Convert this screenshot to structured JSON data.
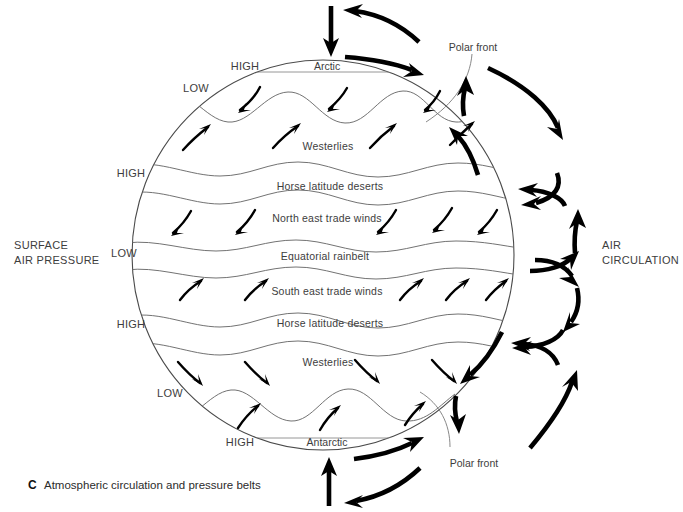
{
  "figure": {
    "caption_letter": "C",
    "caption_text": "Atmospheric circulation and pressure belts"
  },
  "side_labels": {
    "left_line1": "SURFACE",
    "left_line2": "AIR PRESSURE",
    "right_line1": "AIR",
    "right_line2": "CIRCULATION"
  },
  "pressure_belts": [
    {
      "id": "north-polar-high",
      "label": "HIGH"
    },
    {
      "id": "north-subpolar-low",
      "label": "LOW"
    },
    {
      "id": "north-subtropical-high",
      "label": "HIGH"
    },
    {
      "id": "equatorial-low",
      "label": "LOW"
    },
    {
      "id": "south-subtropical-high",
      "label": "HIGH"
    },
    {
      "id": "south-subpolar-low",
      "label": "LOW"
    },
    {
      "id": "south-polar-high",
      "label": "HIGH"
    }
  ],
  "zones": [
    {
      "id": "arctic",
      "label": "Arctic"
    },
    {
      "id": "north-westerlies",
      "label": "Westerlies"
    },
    {
      "id": "north-horse-latitude-deserts",
      "label": "Horse   latitude   deserts"
    },
    {
      "id": "north-east-trade-winds",
      "label": "North east trade winds"
    },
    {
      "id": "equatorial-rainbelt",
      "label": "Equatorial rainbelt"
    },
    {
      "id": "south-east-trade-winds",
      "label": "South east trade winds"
    },
    {
      "id": "south-horse-latitude-deserts",
      "label": "Horse   latitude   deserts"
    },
    {
      "id": "south-westerlies",
      "label": "Westerlies"
    },
    {
      "id": "antarctic",
      "label": "Antarctic"
    }
  ],
  "fronts": [
    {
      "id": "polar-front-north",
      "label": "Polar front"
    },
    {
      "id": "polar-front-south",
      "label": "Polar front"
    }
  ],
  "colors": {
    "outline": "#4a4a4a",
    "belt_line": "#6a6a6a",
    "arrow": "#000000",
    "text": "#3d3d3d",
    "background": "#ffffff"
  }
}
